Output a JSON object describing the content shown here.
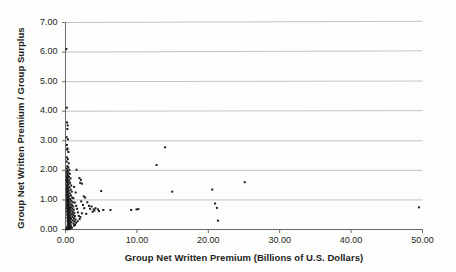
{
  "chart_data": {
    "type": "scatter",
    "title": "",
    "subtitle": "",
    "xlabel": "Group Net Written Premium (Billions of U.S. Dollars)",
    "ylabel": "Group Net Written Premium / Group Surplus",
    "xlim": [
      0.0,
      50.0
    ],
    "ylim": [
      0.0,
      7.0
    ],
    "xticks": [
      0.0,
      10.0,
      20.0,
      30.0,
      40.0,
      50.0
    ],
    "yticks": [
      0.0,
      1.0,
      2.0,
      3.0,
      4.0,
      5.0,
      6.0,
      7.0
    ],
    "xtick_labels": [
      "0.00",
      "10.00",
      "20.00",
      "30.00",
      "40.00",
      "50.00"
    ],
    "ytick_labels": [
      "0.00",
      "1.00",
      "2.00",
      "3.00",
      "4.00",
      "5.00",
      "6.00",
      "7.00"
    ],
    "grid": "horizontal",
    "legend": "none",
    "marker": "square",
    "marker_color": "#1a1a1a",
    "marker_size": 2.0,
    "points": [
      [
        0.12,
        6.1
      ],
      [
        0.18,
        4.12
      ],
      [
        0.22,
        3.62
      ],
      [
        0.3,
        3.52
      ],
      [
        0.26,
        3.4
      ],
      [
        0.15,
        3.12
      ],
      [
        0.34,
        3.05
      ],
      [
        0.2,
        2.86
      ],
      [
        0.28,
        2.74
      ],
      [
        0.24,
        2.7
      ],
      [
        0.4,
        2.62
      ],
      [
        0.19,
        2.44
      ],
      [
        0.33,
        2.38
      ],
      [
        0.17,
        2.3
      ],
      [
        0.45,
        2.24
      ],
      [
        0.26,
        2.14
      ],
      [
        0.38,
        2.1
      ],
      [
        0.22,
        2.06
      ],
      [
        0.55,
        2.02
      ],
      [
        0.3,
        1.99
      ],
      [
        1.55,
        2.02
      ],
      [
        0.16,
        1.96
      ],
      [
        0.42,
        1.93
      ],
      [
        0.21,
        1.9
      ],
      [
        0.6,
        1.88
      ],
      [
        0.27,
        1.85
      ],
      [
        0.35,
        1.82
      ],
      [
        0.18,
        1.8
      ],
      [
        0.48,
        1.78
      ],
      [
        0.24,
        1.75
      ],
      [
        0.7,
        1.73
      ],
      [
        0.31,
        1.71
      ],
      [
        0.14,
        1.69
      ],
      [
        0.52,
        1.66
      ],
      [
        0.23,
        1.64
      ],
      [
        1.95,
        1.74
      ],
      [
        2.15,
        1.68
      ],
      [
        2.05,
        1.58
      ],
      [
        2.3,
        1.55
      ],
      [
        0.36,
        1.62
      ],
      [
        0.19,
        1.6
      ],
      [
        0.64,
        1.58
      ],
      [
        0.28,
        1.56
      ],
      [
        0.44,
        1.53
      ],
      [
        0.17,
        1.51
      ],
      [
        0.8,
        1.49
      ],
      [
        0.32,
        1.47
      ],
      [
        0.22,
        1.45
      ],
      [
        0.56,
        1.43
      ],
      [
        0.26,
        1.41
      ],
      [
        1.2,
        1.44
      ],
      [
        0.38,
        1.39
      ],
      [
        0.15,
        1.37
      ],
      [
        0.72,
        1.35
      ],
      [
        0.29,
        1.33
      ],
      [
        0.47,
        1.31
      ],
      [
        0.2,
        1.29
      ],
      [
        0.88,
        1.28
      ],
      [
        0.34,
        1.26
      ],
      [
        0.24,
        1.24
      ],
      [
        0.61,
        1.22
      ],
      [
        0.27,
        1.2
      ],
      [
        1.42,
        1.25
      ],
      [
        5.0,
        1.3
      ],
      [
        0.41,
        1.18
      ],
      [
        0.16,
        1.16
      ],
      [
        0.76,
        1.15
      ],
      [
        0.31,
        1.13
      ],
      [
        0.5,
        1.11
      ],
      [
        0.21,
        1.09
      ],
      [
        0.95,
        1.08
      ],
      [
        0.36,
        1.06
      ],
      [
        0.25,
        1.05
      ],
      [
        0.66,
        1.03
      ],
      [
        0.29,
        1.01
      ],
      [
        1.1,
        1.06
      ],
      [
        2.55,
        1.12
      ],
      [
        2.75,
        1.08
      ],
      [
        0.44,
        1.0
      ],
      [
        0.18,
        0.99
      ],
      [
        0.82,
        0.97
      ],
      [
        0.33,
        0.96
      ],
      [
        0.54,
        0.94
      ],
      [
        0.23,
        0.93
      ],
      [
        1.02,
        0.92
      ],
      [
        0.38,
        0.9
      ],
      [
        0.27,
        0.89
      ],
      [
        0.71,
        0.88
      ],
      [
        0.31,
        0.86
      ],
      [
        1.3,
        0.91
      ],
      [
        2.2,
        0.95
      ],
      [
        3.05,
        0.92
      ],
      [
        0.47,
        0.85
      ],
      [
        0.19,
        0.84
      ],
      [
        0.89,
        0.83
      ],
      [
        0.35,
        0.81
      ],
      [
        0.58,
        0.8
      ],
      [
        0.25,
        0.79
      ],
      [
        1.08,
        0.78
      ],
      [
        0.4,
        0.77
      ],
      [
        0.29,
        0.76
      ],
      [
        0.77,
        0.75
      ],
      [
        0.33,
        0.74
      ],
      [
        1.5,
        0.8
      ],
      [
        2.45,
        0.83
      ],
      [
        3.3,
        0.8
      ],
      [
        3.65,
        0.78
      ],
      [
        0.51,
        0.73
      ],
      [
        0.21,
        0.72
      ],
      [
        0.96,
        0.71
      ],
      [
        0.37,
        0.7
      ],
      [
        0.63,
        0.69
      ],
      [
        0.27,
        0.68
      ],
      [
        1.16,
        0.67
      ],
      [
        0.43,
        0.66
      ],
      [
        0.31,
        0.65
      ],
      [
        0.84,
        0.64
      ],
      [
        0.35,
        0.63
      ],
      [
        1.62,
        0.7
      ],
      [
        2.62,
        0.72
      ],
      [
        3.45,
        0.7
      ],
      [
        3.95,
        0.68
      ],
      [
        0.55,
        0.62
      ],
      [
        0.23,
        0.61
      ],
      [
        1.03,
        0.6
      ],
      [
        0.39,
        0.59
      ],
      [
        0.68,
        0.58
      ],
      [
        0.29,
        0.57
      ],
      [
        1.24,
        0.56
      ],
      [
        0.46,
        0.55
      ],
      [
        0.33,
        0.54
      ],
      [
        0.9,
        0.53
      ],
      [
        0.37,
        0.52
      ],
      [
        1.74,
        0.58
      ],
      [
        2.3,
        0.55
      ],
      [
        2.9,
        0.53
      ],
      [
        0.59,
        0.51
      ],
      [
        0.25,
        0.5
      ],
      [
        1.1,
        0.49
      ],
      [
        0.42,
        0.48
      ],
      [
        0.72,
        0.47
      ],
      [
        0.31,
        0.46
      ],
      [
        1.32,
        0.45
      ],
      [
        0.49,
        0.44
      ],
      [
        0.35,
        0.43
      ],
      [
        0.97,
        0.42
      ],
      [
        0.4,
        0.41
      ],
      [
        1.86,
        0.46
      ],
      [
        2.08,
        0.42
      ],
      [
        0.63,
        0.4
      ],
      [
        0.27,
        0.39
      ],
      [
        1.18,
        0.38
      ],
      [
        0.45,
        0.37
      ],
      [
        0.77,
        0.36
      ],
      [
        0.33,
        0.35
      ],
      [
        1.4,
        0.34
      ],
      [
        0.52,
        0.33
      ],
      [
        0.38,
        0.32
      ],
      [
        1.04,
        0.31
      ],
      [
        0.43,
        0.3
      ],
      [
        1.98,
        0.35
      ],
      [
        1.7,
        0.28
      ],
      [
        0.67,
        0.29
      ],
      [
        0.29,
        0.28
      ],
      [
        1.26,
        0.27
      ],
      [
        0.48,
        0.26
      ],
      [
        0.82,
        0.25
      ],
      [
        0.36,
        0.24
      ],
      [
        1.48,
        0.23
      ],
      [
        0.56,
        0.22
      ],
      [
        0.41,
        0.21
      ],
      [
        1.12,
        0.2
      ],
      [
        0.46,
        0.19
      ],
      [
        0.71,
        0.18
      ],
      [
        0.31,
        0.17
      ],
      [
        1.34,
        0.16
      ],
      [
        0.6,
        0.15
      ],
      [
        0.44,
        0.14
      ],
      [
        1.2,
        0.13
      ],
      [
        0.5,
        0.12
      ],
      [
        0.76,
        0.11
      ],
      [
        0.34,
        0.1
      ],
      [
        0.26,
        0.09
      ],
      [
        0.58,
        0.08
      ],
      [
        0.39,
        0.07
      ],
      [
        0.9,
        0.06
      ],
      [
        0.47,
        0.05
      ],
      [
        0.22,
        0.05
      ],
      [
        0.65,
        0.04
      ],
      [
        0.3,
        0.04
      ],
      [
        0.18,
        0.03
      ],
      [
        0.52,
        0.03
      ],
      [
        0.36,
        0.02
      ],
      [
        0.14,
        0.02
      ],
      [
        0.62,
        0.02
      ],
      [
        0.28,
        0.01
      ],
      [
        0.2,
        0.01
      ],
      [
        0.44,
        0.01
      ],
      [
        4.2,
        0.72
      ],
      [
        4.55,
        0.68
      ],
      [
        4.05,
        0.64
      ],
      [
        4.7,
        0.62
      ],
      [
        3.8,
        0.6
      ],
      [
        5.3,
        0.66
      ],
      [
        6.3,
        0.66
      ],
      [
        9.2,
        0.66
      ],
      [
        9.95,
        0.68
      ],
      [
        10.2,
        0.69
      ],
      [
        13.95,
        2.78
      ],
      [
        12.75,
        2.18
      ],
      [
        14.95,
        1.28
      ],
      [
        20.55,
        1.35
      ],
      [
        20.95,
        0.88
      ],
      [
        21.2,
        0.73
      ],
      [
        21.35,
        0.3
      ],
      [
        25.1,
        1.6
      ],
      [
        49.5,
        0.75
      ]
    ]
  },
  "axes": {
    "x_title": "Group Net Written Premium (Billions of U.S. Dollars)",
    "y_title": "Group Net Written Premium / Group Surplus"
  },
  "colors": {
    "marker": "#1a1a1a",
    "gridline": "#a9a9a9",
    "axis": "#595959",
    "background": "#fdfdfc",
    "text": "#231f20"
  }
}
